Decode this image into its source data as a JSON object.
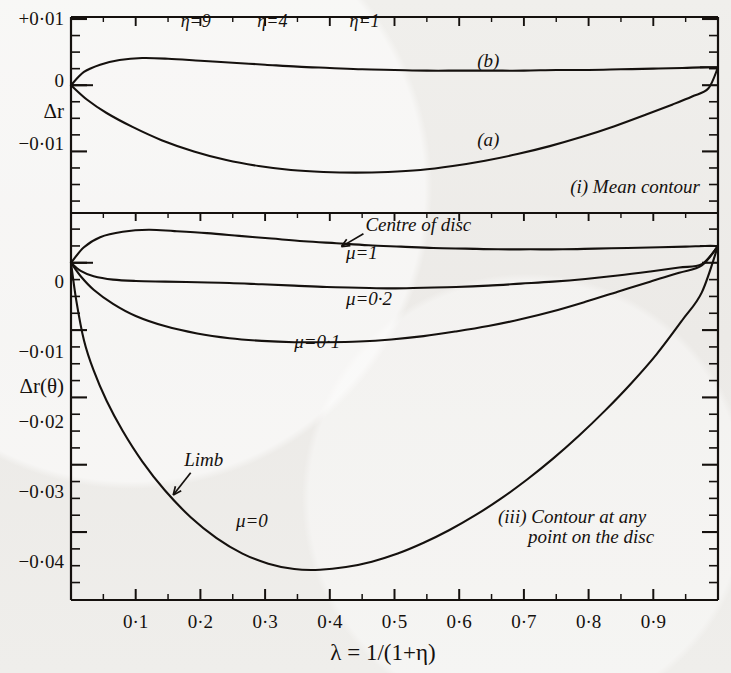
{
  "figure": {
    "background_color": "#efeeeb",
    "ink_color": "#15110e",
    "xlabel": "λ = 1/(1+η)",
    "x_ticks": [
      "0·1",
      "0·2",
      "0·3",
      "0·4",
      "0·5",
      "0·6",
      "0·7",
      "0·8",
      "0·9"
    ],
    "x_tick_values": [
      0.1,
      0.2,
      0.3,
      0.4,
      0.5,
      0.6,
      0.7,
      0.8,
      0.9
    ],
    "xlim": [
      0,
      1.0
    ]
  },
  "panel_top": {
    "label": "(i) Mean contour",
    "ylabel": "Δr",
    "y_ticks": [
      "+0·01",
      "0",
      "−0·01"
    ],
    "y_tick_values": [
      0.01,
      0,
      -0.01
    ],
    "ylim": [
      -0.019,
      0.01
    ],
    "eta_labels": [
      {
        "text": "η=9",
        "lambda": 0.1
      },
      {
        "text": "η=4",
        "lambda": 0.2
      },
      {
        "text": "η=1",
        "lambda": 0.5
      }
    ],
    "curve_labels": [
      {
        "text": "(b)",
        "lambda": 0.645,
        "value": 0.0028
      },
      {
        "text": "(a)",
        "lambda": 0.645,
        "value": -0.0092
      }
    ]
  },
  "panel_bottom": {
    "label_line1": "(iii) Contour at any",
    "label_line2": "point on the disc",
    "ylabel": "Δr(θ)",
    "y_ticks": [
      "0",
      "−0·01",
      "−0·02",
      "−0·03",
      "−0·04"
    ],
    "y_tick_values": [
      0,
      -0.01,
      -0.02,
      -0.03,
      -0.04
    ],
    "ylim": [
      -0.0495,
      0.0068
    ],
    "annotations": [
      {
        "text": "Centre of disc",
        "lambda": 0.455,
        "value": 0.0048,
        "has_arrow": true
      },
      {
        "text": "Limb",
        "lambda": 0.175,
        "value": -0.0302,
        "has_arrow": true
      }
    ],
    "curve_labels": [
      {
        "text": "μ=1",
        "lambda": 0.425,
        "value": 0.0005
      },
      {
        "text": "μ=0·2",
        "lambda": 0.425,
        "value": -0.0063
      },
      {
        "text": "μ=0·1",
        "lambda": 0.345,
        "value": -0.0126
      },
      {
        "text": "μ=0",
        "lambda": 0.255,
        "value": -0.0392
      }
    ]
  },
  "chart_data": {
    "type": "line",
    "xlabel": "λ = 1/(1+η)",
    "xlim": [
      0,
      1.0
    ],
    "grid": false,
    "legend": "inline-labels",
    "panels": [
      {
        "name": "(i) Mean contour",
        "ylabel": "Δr",
        "ylim": [
          -0.019,
          0.01
        ],
        "yticks": [
          0.01,
          0,
          -0.01
        ],
        "series": [
          {
            "name": "(b)",
            "x": [
              0.0,
              0.02,
              0.045,
              0.075,
              0.11,
              0.15,
              0.2,
              0.25,
              0.3,
              0.35,
              0.4,
              0.45,
              0.5,
              0.55,
              0.6,
              0.65,
              0.7,
              0.75,
              0.8,
              0.85,
              0.9,
              0.945,
              0.975,
              1.0
            ],
            "values": [
              0.0,
              0.002,
              0.0031,
              0.0038,
              0.0041,
              0.004,
              0.0037,
              0.0034,
              0.0031,
              0.0028,
              0.0026,
              0.0024,
              0.0023,
              0.0022,
              0.0022,
              0.0022,
              0.0022,
              0.0023,
              0.0023,
              0.0024,
              0.0025,
              0.0026,
              0.0027,
              0.0027
            ]
          },
          {
            "name": "(a)",
            "x": [
              0.0,
              0.025,
              0.055,
              0.095,
              0.14,
              0.19,
              0.24,
              0.29,
              0.34,
              0.39,
              0.44,
              0.49,
              0.54,
              0.59,
              0.64,
              0.69,
              0.74,
              0.79,
              0.84,
              0.89,
              0.93,
              0.96,
              0.985,
              1.0
            ],
            "values": [
              0.0,
              -0.0022,
              -0.0042,
              -0.0063,
              -0.0083,
              -0.01,
              -0.0113,
              -0.0122,
              -0.0128,
              -0.0131,
              -0.0132,
              -0.0131,
              -0.0128,
              -0.0122,
              -0.0114,
              -0.0104,
              -0.0092,
              -0.0078,
              -0.0062,
              -0.0044,
              -0.0029,
              -0.0017,
              -0.0005,
              0.0027
            ]
          }
        ]
      },
      {
        "name": "(iii) Contour at any point on the disc",
        "ylabel": "Δr(θ)",
        "ylim": [
          -0.0495,
          0.0068
        ],
        "yticks": [
          0,
          -0.01,
          -0.02,
          -0.03,
          -0.04
        ],
        "series": [
          {
            "name": "μ=1 (Centre of disc)",
            "x": [
              0.0,
              0.02,
              0.045,
              0.08,
              0.12,
              0.16,
              0.21,
              0.26,
              0.31,
              0.36,
              0.41,
              0.46,
              0.51,
              0.56,
              0.61,
              0.66,
              0.71,
              0.76,
              0.81,
              0.86,
              0.91,
              0.95,
              0.98,
              1.0
            ],
            "values": [
              0.0,
              0.0023,
              0.0038,
              0.0046,
              0.0049,
              0.0047,
              0.0044,
              0.004,
              0.0036,
              0.0032,
              0.0029,
              0.0026,
              0.0024,
              0.0022,
              0.0021,
              0.002,
              0.002,
              0.002,
              0.0021,
              0.0022,
              0.0023,
              0.0024,
              0.0025,
              0.0025
            ]
          },
          {
            "name": "μ=0·2",
            "x": [
              0.0,
              0.015,
              0.035,
              0.065,
              0.1,
              0.145,
              0.195,
              0.245,
              0.295,
              0.345,
              0.395,
              0.445,
              0.495,
              0.545,
              0.595,
              0.645,
              0.695,
              0.745,
              0.795,
              0.845,
              0.895,
              0.94,
              0.975,
              1.0
            ],
            "values": [
              0.0,
              -0.0012,
              -0.002,
              -0.0025,
              -0.0027,
              -0.0028,
              -0.0029,
              -0.003,
              -0.0032,
              -0.0034,
              -0.0036,
              -0.0037,
              -0.0038,
              -0.0037,
              -0.0036,
              -0.0034,
              -0.0031,
              -0.0028,
              -0.0024,
              -0.0019,
              -0.0013,
              -0.0007,
              -0.0002,
              0.0025
            ]
          },
          {
            "name": "μ=0·1",
            "x": [
              0.0,
              0.015,
              0.035,
              0.065,
              0.1,
              0.145,
              0.195,
              0.245,
              0.295,
              0.345,
              0.395,
              0.445,
              0.495,
              0.545,
              0.595,
              0.645,
              0.695,
              0.745,
              0.795,
              0.845,
              0.895,
              0.94,
              0.975,
              1.0
            ],
            "values": [
              0.0,
              -0.002,
              -0.004,
              -0.0061,
              -0.0079,
              -0.0094,
              -0.0105,
              -0.0112,
              -0.0116,
              -0.0118,
              -0.0118,
              -0.0117,
              -0.0114,
              -0.0109,
              -0.0102,
              -0.0094,
              -0.0084,
              -0.0072,
              -0.0058,
              -0.0043,
              -0.0028,
              -0.0015,
              -0.0004,
              0.0025
            ]
          },
          {
            "name": "μ=0 (Limb)",
            "x": [
              0.0,
              0.008,
              0.02,
              0.035,
              0.055,
              0.08,
              0.11,
              0.145,
              0.185,
              0.225,
              0.265,
              0.305,
              0.345,
              0.385,
              0.425,
              0.465,
              0.505,
              0.545,
              0.585,
              0.625,
              0.665,
              0.705,
              0.745,
              0.785,
              0.825,
              0.865,
              0.905,
              0.945,
              0.975,
              1.0
            ],
            "values": [
              0.0,
              -0.0055,
              -0.0115,
              -0.016,
              -0.0205,
              -0.025,
              -0.0295,
              -0.0338,
              -0.0378,
              -0.0409,
              -0.0432,
              -0.0447,
              -0.0455,
              -0.0456,
              -0.0452,
              -0.0444,
              -0.0432,
              -0.0416,
              -0.0397,
              -0.0375,
              -0.035,
              -0.0322,
              -0.0291,
              -0.0257,
              -0.022,
              -0.018,
              -0.0136,
              -0.0085,
              -0.0044,
              0.0025
            ]
          }
        ]
      }
    ]
  }
}
